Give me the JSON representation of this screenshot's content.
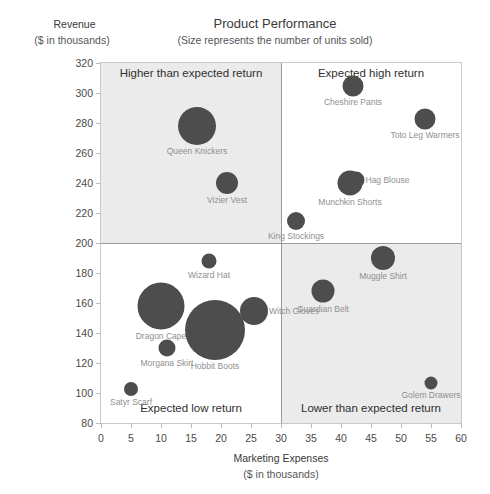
{
  "chart_data": {
    "type": "scatter",
    "title": "Product Performance",
    "subtitle": "(Size represents the number of units sold)",
    "xlabel": "Marketing Expenses",
    "xlabel_sub": "($ in thousands)",
    "ylabel": "Revenue",
    "ylabel_sub": "($ in thousands)",
    "xlim": [
      0,
      60
    ],
    "ylim": [
      80,
      320
    ],
    "xticks": [
      0,
      5,
      10,
      15,
      20,
      25,
      30,
      35,
      40,
      45,
      50,
      55,
      60
    ],
    "yticks": [
      80,
      100,
      120,
      140,
      160,
      180,
      200,
      220,
      240,
      260,
      280,
      300,
      320
    ],
    "grid": false,
    "legend": "none",
    "bubble_color": "#4d4d4d",
    "quadrant_split": {
      "x": 30,
      "y": 200
    },
    "quadrants": [
      {
        "key": "top-left",
        "label": "Higher than expected return",
        "shaded": true
      },
      {
        "key": "top-right",
        "label": "Expected high return",
        "shaded": false
      },
      {
        "key": "bottom-left",
        "label": "Expected low return",
        "shaded": false
      },
      {
        "key": "bottom-right",
        "label": "Lower than expected return",
        "shaded": true
      }
    ],
    "points": [
      {
        "label": "Queen Knickers",
        "x": 16.0,
        "y": 278,
        "size": 38,
        "anchor": "center"
      },
      {
        "label": "Vizier Vest",
        "x": 21.0,
        "y": 240,
        "size": 22,
        "anchor": "center"
      },
      {
        "label": "Cheshire Pants",
        "x": 42.0,
        "y": 305,
        "size": 21,
        "anchor": "center"
      },
      {
        "label": "Toto Leg Warmers",
        "x": 54.0,
        "y": 283,
        "size": 21,
        "anchor": "center"
      },
      {
        "label": "Hag Blouse",
        "x": 42.5,
        "y": 242,
        "size": 17,
        "anchor": "left"
      },
      {
        "label": "Munchkin Shorts",
        "x": 41.5,
        "y": 240,
        "size": 25,
        "anchor": "center"
      },
      {
        "label": "King Stockings",
        "x": 32.5,
        "y": 215,
        "size": 18,
        "anchor": "center"
      },
      {
        "label": "Wizard Hat",
        "x": 18.0,
        "y": 188,
        "size": 15,
        "anchor": "center"
      },
      {
        "label": "Muggle Shirt",
        "x": 47.0,
        "y": 190,
        "size": 24,
        "anchor": "center"
      },
      {
        "label": "Guardian Belt",
        "x": 37.0,
        "y": 168,
        "size": 23,
        "anchor": "center"
      },
      {
        "label": "Dragon Cape",
        "x": 10.0,
        "y": 158,
        "size": 47,
        "anchor": "center"
      },
      {
        "label": "Witch Gloves",
        "x": 25.5,
        "y": 155,
        "size": 28,
        "anchor": "left"
      },
      {
        "label": "Hobbit Boots",
        "x": 19.0,
        "y": 142,
        "size": 60,
        "anchor": "center"
      },
      {
        "label": "Morgana Skirt",
        "x": 11.0,
        "y": 130,
        "size": 17,
        "anchor": "center"
      },
      {
        "label": "Satyr Scarf",
        "x": 5.0,
        "y": 103,
        "size": 14,
        "anchor": "center"
      },
      {
        "label": "Golem Drawers",
        "x": 55.0,
        "y": 107,
        "size": 13,
        "anchor": "center"
      }
    ]
  }
}
